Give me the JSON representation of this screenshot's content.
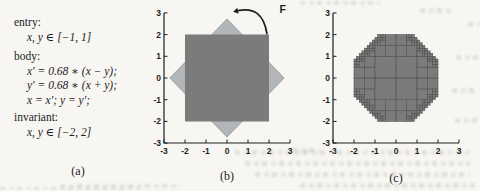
{
  "program": {
    "entry_label": "entry:",
    "entry_value": "x, y ∈ [−1, 1]",
    "body_label": "body:",
    "body_lines": [
      "x′ = 0.68 ∗ (x − y);",
      "y′ = 0.68 ∗ (x + y);",
      "x = x′; y = y′;"
    ],
    "invariant_label": "invariant:",
    "invariant_value": "x, y ∈ [−2, 2]"
  },
  "captions": {
    "a": "(a)",
    "b": "(b)",
    "c": "(c)"
  },
  "colors": {
    "dark_region": "#7b7b7b",
    "light_region": "#b3b6b9",
    "light_region_edge": "#8f9497",
    "cell_stroke": "#4d4d4d",
    "axis": "#1f1f1f",
    "text": "#1c1c1c",
    "background": "#f7f6f3"
  },
  "chart_data": [
    {
      "id": "b",
      "type": "area",
      "caption": "(b)",
      "xlim": [
        -3,
        3
      ],
      "ylim": [
        -3,
        3
      ],
      "xticks": [
        -3,
        -2,
        -1,
        0,
        1,
        2,
        3
      ],
      "yticks": [
        -3,
        -2,
        -1,
        0,
        1,
        2,
        3
      ],
      "grid": false,
      "shapes": [
        {
          "name": "mapped-diamond",
          "desc": "image of the invariant box under F: square rotated 45 deg, vertices at (0,2.72),(2.72,0),(0,-2.72),(-2.72,0)",
          "points": [
            [
              0,
              2.72
            ],
            [
              2.72,
              0
            ],
            [
              0,
              -2.72
            ],
            [
              -2.72,
              0
            ]
          ],
          "fill": "light_region",
          "stroke": "light_region_edge"
        },
        {
          "name": "invariant-box",
          "desc": "square [-2,2] x [-2,2]",
          "points": [
            [
              -2,
              2
            ],
            [
              2,
              2
            ],
            [
              2,
              -2
            ],
            [
              -2,
              -2
            ]
          ],
          "fill": "dark_region",
          "stroke": "none"
        }
      ],
      "annotation": {
        "label": "F",
        "type": "curved-arrow",
        "from": [
          1.9,
          2.05
        ],
        "to": [
          0.52,
          3.1
        ],
        "label_pos": [
          2.5,
          3.2
        ]
      }
    },
    {
      "id": "c",
      "type": "area",
      "caption": "(c)",
      "xlim": [
        -3,
        3
      ],
      "ylim": [
        -3,
        3
      ],
      "xticks": [
        -3,
        -2,
        -1,
        0,
        1,
        2,
        3
      ],
      "yticks": [
        -3,
        -2,
        -1,
        0,
        1,
        2,
        3
      ],
      "grid": false,
      "region": {
        "name": "reachable-set-paving",
        "desc": "octagon |x|<=2, |y|<=2, |x+y|<=2.72, |x-y|<=2.72 covered by adaptive quadtree boxes",
        "box": [
          -2,
          2
        ],
        "diag": 2.72,
        "min_cell": 0.125,
        "fill": "dark_region",
        "stroke": "cell_stroke"
      }
    }
  ]
}
